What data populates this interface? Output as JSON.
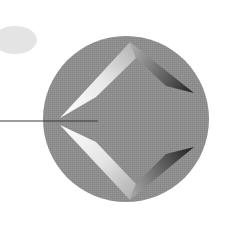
{
  "figure": {
    "width": 239,
    "height": 225,
    "background": "#ffffff",
    "ellipse": {
      "cx": 15,
      "cy": 40,
      "rx": 22,
      "ry": 14,
      "color": "#e4e4e4"
    },
    "circle": {
      "cx": 126,
      "cy": 119,
      "r": 83,
      "color": "#8e8e8e"
    },
    "leader_line": {
      "x1": 0,
      "y1": 121,
      "x2": 98,
      "y2": 121,
      "color": "#3a3a3a"
    },
    "diamond": {
      "left_tip_upper": [
        60,
        118
      ],
      "left_tip_lower": [
        60,
        125
      ],
      "top_vertex": [
        130,
        42
      ],
      "bottom_vertex": [
        130,
        200
      ],
      "right_tip_upper": [
        194,
        93
      ],
      "right_tip_lower": [
        194,
        147
      ],
      "face_color": "#8c8c8c",
      "light_color": "#ffffff",
      "dark_color": "#2a2a2a"
    }
  }
}
